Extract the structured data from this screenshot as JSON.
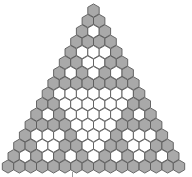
{
  "diagram": {
    "title": "",
    "type": "hexagonal-triangle",
    "rows": 16,
    "modulus": 2,
    "colors": {
      "odd_fill": "#a9a9a9",
      "even_fill": "#ffffff",
      "stroke": "#5a5a5a",
      "background": "#ffffff"
    },
    "geometry": {
      "top_center_x": 93.5,
      "top_center_y": 10.5,
      "hex_width": 11.4,
      "row_spacing": 10.4
    }
  }
}
